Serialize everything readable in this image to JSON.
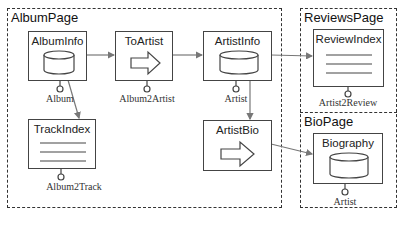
{
  "diagram": {
    "regions": [
      {
        "id": "album-page",
        "label": "AlbumPage"
      },
      {
        "id": "reviews-page",
        "label": "ReviewsPage"
      },
      {
        "id": "bio-page",
        "label": "BioPage"
      }
    ],
    "nodes": {
      "album_info": {
        "label": "AlbumInfo",
        "type": "data",
        "port": "Album"
      },
      "to_artist": {
        "label": "ToArtist",
        "type": "transition",
        "port": "Album2Artist"
      },
      "artist_info": {
        "label": "ArtistInfo",
        "type": "data",
        "port": "Artist"
      },
      "review_index": {
        "label": "ReviewIndex",
        "type": "index",
        "port": "Artist2Review"
      },
      "track_index": {
        "label": "TrackIndex",
        "type": "index",
        "port": "Album2Track"
      },
      "artist_bio": {
        "label": "ArtistBio",
        "type": "transition",
        "port": ""
      },
      "biography": {
        "label": "Biography",
        "type": "data",
        "port": "Artist"
      }
    },
    "edges": [
      {
        "from": "AlbumInfo",
        "to": "ToArtist"
      },
      {
        "from": "ToArtist",
        "to": "ArtistInfo"
      },
      {
        "from": "ArtistInfo",
        "to": "ReviewIndex"
      },
      {
        "from": "AlbumInfo",
        "to": "TrackIndex"
      },
      {
        "from": "ArtistInfo",
        "to": "ArtistBio"
      },
      {
        "from": "ArtistBio",
        "to": "Biography"
      }
    ],
    "colors": {
      "line": "#444444",
      "arrow": "#777777",
      "background": "#ffffff"
    }
  }
}
